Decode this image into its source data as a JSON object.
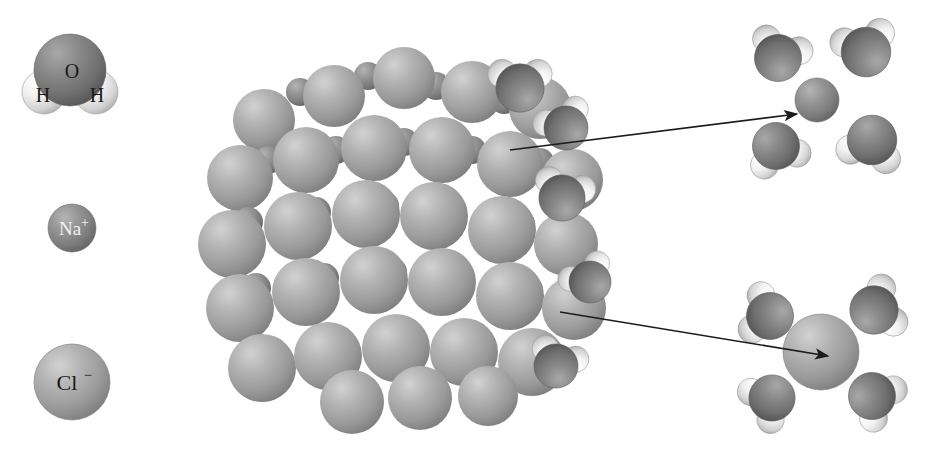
{
  "figure": {
    "background_color": "#ffffff"
  },
  "legend": {
    "items": [
      {
        "id": "water-molecule",
        "name": "water molecule",
        "oxygen_label": "O",
        "hydrogen_label_left": "H",
        "hydrogen_label_right": "H",
        "center": [
          70,
          78
        ],
        "oxygen_color": "#7e7e7e",
        "hydrogen_color": "#e9e9e9",
        "label_color": "#1a1a1a"
      },
      {
        "id": "sodium-ion",
        "name": "sodium ion",
        "label": "Na",
        "charge": "+",
        "center": [
          72,
          228
        ],
        "radius": 24,
        "color": "#8c8c8c",
        "label_color": "#f2f2f2"
      },
      {
        "id": "chloride-ion",
        "name": "chloride ion",
        "label": "Cl",
        "charge": "−",
        "center": [
          72,
          382
        ],
        "radius": 38,
        "color": "#a9a9a9",
        "label_color": "#1a1a1a"
      }
    ]
  },
  "crystal": {
    "name": "sodium chloride crystal lattice",
    "center": [
      400,
      232
    ],
    "chloride_color": "#a5a5a5",
    "sodium_color": "#8a8a8a",
    "note": "space-filling cubic lattice of alternating large Cl- and small Na+ spheres"
  },
  "arrows": [
    {
      "id": "arrow-sodium-hydration",
      "name": "arrow to hydrated sodium ion",
      "from": [
        510,
        150
      ],
      "to": [
        797,
        114
      ],
      "color": "#1c1c1c"
    },
    {
      "id": "arrow-chloride-hydration",
      "name": "arrow to hydrated chloride ion",
      "from": [
        560,
        312
      ],
      "to": [
        828,
        356
      ],
      "color": "#1c1c1c"
    }
  ],
  "hydrated_clusters": [
    {
      "id": "hydrated-sodium",
      "name": "hydrated sodium ion",
      "center": [
        815,
        98
      ],
      "ion": "Na+",
      "ion_radius": 22,
      "ion_color": "#8a8a8a",
      "water_count": 4
    },
    {
      "id": "hydrated-chloride",
      "name": "hydrated chloride ion",
      "center": [
        822,
        350
      ],
      "ion": "Cl-",
      "ion_radius": 38,
      "ion_color": "#a5a5a5",
      "water_count": 4
    }
  ],
  "surface_waters": {
    "name": "water molecules attached to crystal surface",
    "count": 5
  },
  "colors": {
    "oxygen": "#7e7e7e",
    "hydrogen": "#ececec",
    "chloride": "#a5a5a5",
    "sodium": "#8a8a8a",
    "arrow": "#1c1c1c",
    "text_dark": "#1a1a1a",
    "text_light": "#f2f2f2"
  }
}
